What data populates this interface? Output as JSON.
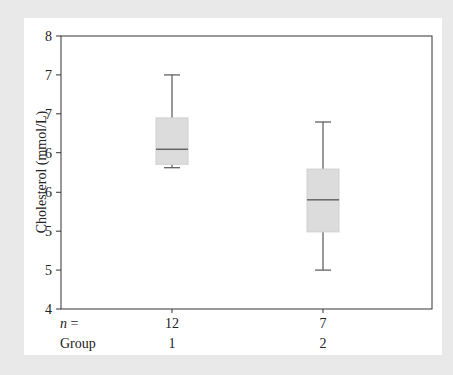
{
  "chart_data": {
    "type": "boxplot",
    "title": "",
    "xlabel": "Group",
    "ylabel": "Cholesterol (mmol/L)",
    "ylim": [
      4,
      8
    ],
    "y_ticks": [
      {
        "value": 8.0,
        "label": "8"
      },
      {
        "value": 7.43,
        "label": "7"
      },
      {
        "value": 6.86,
        "label": "7"
      },
      {
        "value": 6.29,
        "label": "6"
      },
      {
        "value": 5.71,
        "label": "6"
      },
      {
        "value": 5.14,
        "label": "5"
      },
      {
        "value": 4.57,
        "label": "5"
      },
      {
        "value": 4.0,
        "label": "4"
      }
    ],
    "n_label": "n =",
    "group_label": "Group",
    "categories": [
      "1",
      "2"
    ],
    "series": [
      {
        "group": "1",
        "n": 12,
        "whisker_high": 7.43,
        "q3": 6.8,
        "median": 6.34,
        "q1": 6.12,
        "whisker_low": 6.07
      },
      {
        "group": "2",
        "n": 7,
        "whisker_high": 6.74,
        "q3": 6.05,
        "median": 5.6,
        "q1": 5.13,
        "whisker_low": 4.57
      }
    ],
    "grid": false,
    "colors": {
      "box_fill": "#dcdcdc",
      "box_stroke": "#d0d0d0",
      "median": "#666666",
      "whisker": "#555555",
      "frame": "#333333",
      "background": "#e9e9e9",
      "panel": "#ffffff"
    }
  }
}
